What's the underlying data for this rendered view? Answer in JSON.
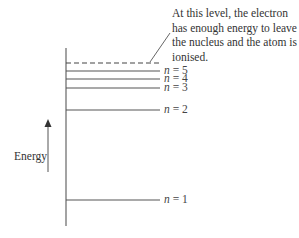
{
  "diagram": {
    "annotation": "At this level, the electron has enough energy to leave the nucleus and the atom is ionised.",
    "axis_label": "Energy",
    "levels": [
      {
        "n": "n",
        "eq": " = 5",
        "style": "solid"
      },
      {
        "n": "n",
        "eq": " = 4",
        "style": "solid"
      },
      {
        "n": "n",
        "eq": " = 3",
        "style": "solid"
      },
      {
        "n": "n",
        "eq": " = 2",
        "style": "solid"
      },
      {
        "n": "n",
        "eq": " = 1",
        "style": "solid"
      }
    ],
    "ionisation_level": {
      "style": "dashed"
    },
    "line_color": "#555555"
  }
}
